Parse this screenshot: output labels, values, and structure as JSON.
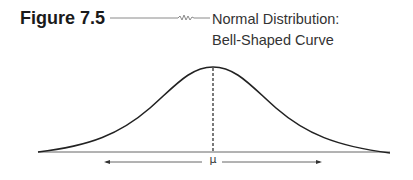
{
  "figure": {
    "label": "Figure 7.5",
    "title_line1": "Normal Distribution:",
    "title_line2": "Bell-Shaped Curve"
  },
  "diagram": {
    "type": "normal-distribution",
    "curve": "bell-shaped",
    "center_label": "μ",
    "center_line_style": "dashed",
    "axis_arrows": "bidirectional from mean",
    "colors": {
      "curve": "#222222",
      "baseline": "#555555",
      "text": "#333333"
    }
  }
}
